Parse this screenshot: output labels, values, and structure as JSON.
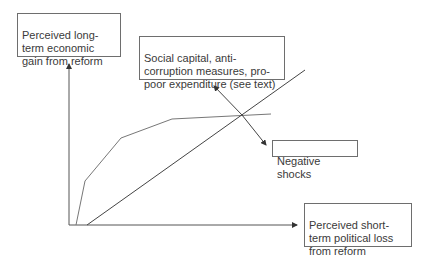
{
  "diagram": {
    "y_axis_label": "Perceived long-term economic gain from reform",
    "x_axis_label": "Perceived short-term political loss from reform",
    "shift_up_label": "Social capital, anti-corruption measures, pro-poor expenditure (see text)",
    "shift_down_label": "Negative shocks",
    "colors": {
      "axis": "#555555",
      "curve": "#777777",
      "line": "#444444",
      "box_border": "#6e6e6e"
    },
    "elements": {
      "y_axis": {
        "from": [
          69,
          225
        ],
        "to": [
          69,
          63
        ]
      },
      "x_axis": {
        "from": [
          69,
          225
        ],
        "to": [
          298,
          225
        ]
      },
      "gain_curve": [
        [
          76,
          225
        ],
        [
          85,
          181
        ],
        [
          121,
          138
        ],
        [
          172,
          119
        ],
        [
          271,
          114
        ]
      ],
      "loss_line": {
        "from": [
          87,
          225
        ],
        "to": [
          305,
          70
        ]
      },
      "intersection": [
        242,
        115
      ],
      "shift_arrow": {
        "up_tip": [
          213,
          85
        ],
        "down_tip": [
          266,
          145
        ]
      }
    }
  }
}
